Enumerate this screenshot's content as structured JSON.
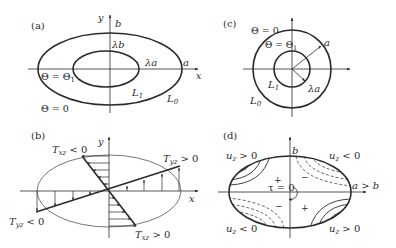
{
  "panels": {
    "a": {
      "label": "(a)",
      "axis_x": "x",
      "axis_y": "y",
      "b_label": "b",
      "lambda_b": "λb",
      "lambda_a": "λa",
      "a_label": "a",
      "theta_inner": "Θ = Θ",
      "theta_inner_sub": "1",
      "theta_outer": "Θ = 0",
      "L1": "L",
      "L1_sub": "1",
      "L0": "L",
      "L0_sub": "0"
    },
    "b": {
      "label": "(b)",
      "axis_x": "x",
      "axis_y": "y",
      "txz_neg": "T",
      "txz_neg_sub": "xz",
      "txz_neg_rel": " < 0",
      "tyz_pos": "T",
      "tyz_pos_sub": "yz",
      "tyz_pos_rel": " > 0",
      "tyz_neg": "T",
      "tyz_neg_sub": "yz",
      "tyz_neg_rel": " < 0",
      "txz_pos": "T",
      "txz_pos_sub": "xz",
      "txz_pos_rel": " > 0"
    },
    "c": {
      "label": "(c)",
      "theta_outer": "Θ = 0",
      "theta_inner": "Θ = Θ",
      "theta_inner_sub": "1",
      "a_label": "a",
      "lambda_a": "λa",
      "L1": "L",
      "L1_sub": "1",
      "L0": "L",
      "L0_sub": "0"
    },
    "d": {
      "label": "(d)",
      "b_label": "b",
      "a_gt_b": "a > b",
      "tau": "τ = 0",
      "uz_tl": "u",
      "uz_tl_sub": "z",
      "uz_tl_rel": " > 0",
      "uz_tr": "u",
      "uz_tr_sub": "z",
      "uz_tr_rel": " < 0",
      "uz_bl": "u",
      "uz_bl_sub": "z",
      "uz_bl_rel": " < 0",
      "uz_br": "u",
      "uz_br_sub": "z",
      "uz_br_rel": " > 0",
      "plus": "+",
      "minus": "−"
    }
  },
  "colors": {
    "line": "#2a2a2a",
    "thin": "#555555"
  }
}
